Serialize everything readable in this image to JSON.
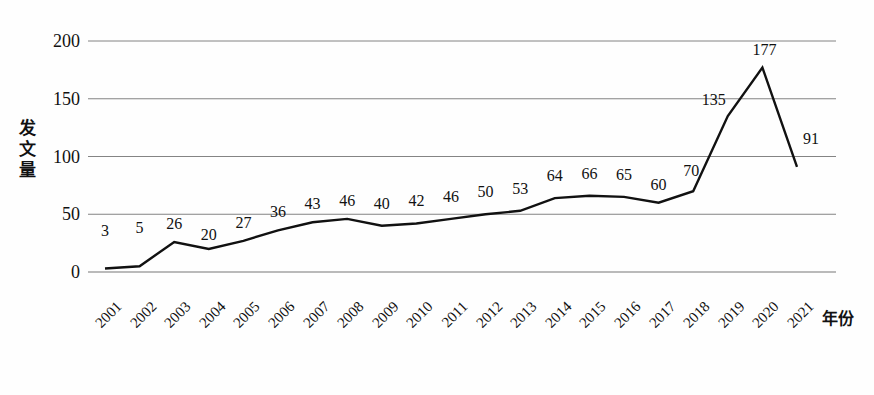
{
  "chart_data": {
    "type": "line",
    "title": "",
    "xlabel": "年份",
    "ylabel": "发文量",
    "ylabel_chars": [
      "发",
      "文",
      "量"
    ],
    "categories": [
      "2001",
      "2002",
      "2003",
      "2004",
      "2005",
      "2006",
      "2007",
      "2008",
      "2009",
      "2010",
      "2011",
      "2012",
      "2013",
      "2014",
      "2015",
      "2016",
      "2017",
      "2018",
      "2019",
      "2020",
      "2021"
    ],
    "values": [
      3,
      5,
      26,
      20,
      27,
      36,
      43,
      46,
      40,
      42,
      46,
      50,
      53,
      64,
      66,
      65,
      60,
      70,
      135,
      177,
      91
    ],
    "point_labels": [
      "3",
      "5",
      "26",
      "20",
      "27",
      "36",
      "43",
      "46",
      "40",
      "42",
      "46",
      "50",
      "53",
      "64",
      "66",
      "65",
      "60",
      "70",
      "135",
      "177",
      "91"
    ],
    "ylim": [
      0,
      200
    ],
    "yticks": [
      0,
      50,
      100,
      150,
      200
    ],
    "ytick_labels": [
      "0",
      "50",
      "100",
      "150",
      "200"
    ],
    "grid": true,
    "grid_axis": "y",
    "legend": "none",
    "series_color": "#111111",
    "grid_color": "#767676",
    "line_width": 2.4
  },
  "axes": {
    "y_title": "发文量",
    "x_title": "年份"
  }
}
